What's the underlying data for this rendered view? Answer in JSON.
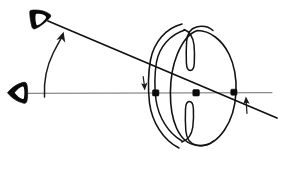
{
  "figure": {
    "kind": "hand-drawn-optics-diagram",
    "title": "Schematic eye with oblique and axial viewing directions",
    "background_color": "#ffffff",
    "ink_color": "#121212",
    "axis_color": "#8a8a8a",
    "ray_color": "#111111",
    "width": 281,
    "height": 169
  },
  "observers": {
    "oblique": {
      "name": "oblique-observer-eye",
      "glyph": "eye-triangle-pointing-down-right",
      "x": 40,
      "y": 18
    },
    "axial": {
      "name": "axial-observer-eye",
      "glyph": "eye-triangle-pointing-right",
      "x": 16,
      "y": 92
    }
  },
  "lines": {
    "optical_axis": {
      "name": "optical-axis",
      "from_x": 28,
      "from_y": 93,
      "to_x": 272,
      "to_y": 93,
      "color": "#8a8a8a"
    },
    "oblique_ray": {
      "name": "oblique-visual-ray",
      "from_x": 48,
      "from_y": 21,
      "to_x": 277,
      "to_y": 118,
      "color": "#111111"
    }
  },
  "markers": {
    "cornea_vertex": {
      "name": "cornea-intersection-node",
      "x": 156,
      "y": 93
    },
    "nodal_point": {
      "name": "nodal-point-node",
      "x": 196,
      "y": 93
    },
    "lens_exit": {
      "name": "lens-exit-node",
      "x": 234,
      "y": 93
    }
  },
  "annotations": [
    {
      "name": "rotation-arrow",
      "glyph": "curved-arrow-up",
      "description": "curved arrow sweeping upward toward the oblique observer"
    },
    {
      "name": "entrance-shift-arrow",
      "glyph": "arrow-down",
      "description": "small downward arrow at corneal entrance"
    },
    {
      "name": "exit-shift-arrow",
      "glyph": "arrow-up",
      "description": "small upward arrow beyond the lens exit"
    }
  ],
  "structures": [
    {
      "name": "cornea-outer-arc",
      "label": "cornea outer surface"
    },
    {
      "name": "cornea-inner-arc",
      "label": "cornea inner surface"
    },
    {
      "name": "iris-upper-fold",
      "label": "upper iris fold"
    },
    {
      "name": "iris-lower-fold",
      "label": "lower iris fold"
    },
    {
      "name": "crystalline-lens-outline",
      "label": "crystalline lens"
    }
  ]
}
